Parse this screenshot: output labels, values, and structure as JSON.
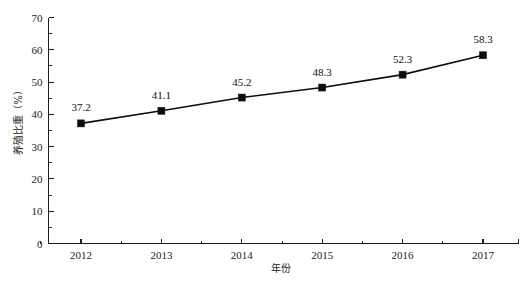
{
  "chart_data": {
    "type": "line",
    "title": "",
    "xlabel": "年份",
    "ylabel": "养殖比重（%）",
    "categories": [
      "2012",
      "2013",
      "2014",
      "2015",
      "2016",
      "2017"
    ],
    "values": [
      37.2,
      41.1,
      45.2,
      48.3,
      52.3,
      58.3
    ],
    "series": [
      {
        "name": "养殖比重",
        "values": [
          37.2,
          41.1,
          45.2,
          48.3,
          52.3,
          58.3
        ]
      }
    ],
    "point_labels": [
      "37.2",
      "41.1",
      "45.2",
      "48.3",
      "52.3",
      "58.3"
    ],
    "ylim": [
      0,
      70
    ],
    "y_ticks": [
      "0",
      "10",
      "20",
      "30",
      "40",
      "50",
      "60",
      "70"
    ],
    "y_minor_step": 5,
    "x_ticks": [
      "2012",
      "2013",
      "2014",
      "2015",
      "2016",
      "2017"
    ],
    "grid": false,
    "legend": "none",
    "marker": "square",
    "line_color": "#0d0d0d",
    "marker_color": "#0d0d0d",
    "axis_color": "#1b1b1b",
    "background": "#ffffff"
  },
  "axes": {
    "y_axis_title": "养殖比重（%）",
    "x_axis_title": "年份"
  }
}
